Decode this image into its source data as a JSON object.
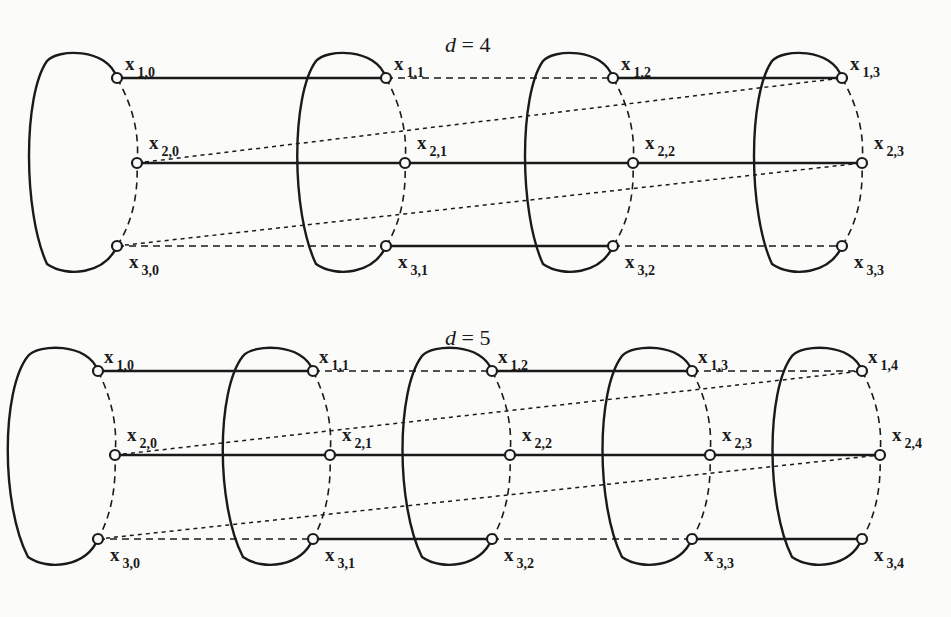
{
  "figure": {
    "panels": [
      {
        "title_var": "d",
        "title_eq": " = 4",
        "d": 4,
        "columns": 4,
        "rows": 3,
        "labels": [
          [
            "x_{1,0}",
            "x_{1,1}",
            "x_{1,2}",
            "x_{1,3}"
          ],
          [
            "x_{2,0}",
            "x_{2,1}",
            "x_{2,2}",
            "x_{2,3}"
          ],
          [
            "x_{3,0}",
            "x_{3,1}",
            "x_{3,2}",
            "x_{3,3}"
          ]
        ],
        "edges_solid": [
          [
            [
              1,
              0
            ],
            [
              1,
              1
            ]
          ],
          [
            [
              1,
              2
            ],
            [
              1,
              3
            ]
          ],
          [
            [
              2,
              0
            ],
            [
              2,
              1
            ]
          ],
          [
            [
              2,
              1
            ],
            [
              2,
              2
            ]
          ],
          [
            [
              2,
              2
            ],
            [
              2,
              3
            ]
          ],
          [
            [
              3,
              1
            ],
            [
              3,
              2
            ]
          ]
        ],
        "edges_dashed": [
          [
            [
              1,
              1
            ],
            [
              1,
              2
            ]
          ],
          [
            [
              3,
              0
            ],
            [
              3,
              1
            ]
          ],
          [
            [
              3,
              2
            ],
            [
              3,
              3
            ]
          ]
        ],
        "edges_wrap_dotted": [
          [
            [
              2,
              0
            ],
            [
              1,
              3
            ]
          ],
          [
            [
              3,
              0
            ],
            [
              2,
              3
            ]
          ]
        ]
      },
      {
        "title_var": "d",
        "title_eq": " = 5",
        "d": 5,
        "columns": 5,
        "rows": 3,
        "labels": [
          [
            "x_{1,0}",
            "x_{1,1}",
            "x_{1,2}",
            "x_{1,3}",
            "x_{1,4}"
          ],
          [
            "x_{2,0}",
            "x_{2,1}",
            "x_{2,2}",
            "x_{2,3}",
            "x_{2,4}"
          ],
          [
            "x_{3,0}",
            "x_{3,1}",
            "x_{3,2}",
            "x_{3,3}",
            "x_{3,4}"
          ]
        ],
        "edges_solid": [
          [
            [
              1,
              0
            ],
            [
              1,
              1
            ]
          ],
          [
            [
              1,
              2
            ],
            [
              1,
              3
            ]
          ],
          [
            [
              2,
              0
            ],
            [
              2,
              1
            ]
          ],
          [
            [
              2,
              1
            ],
            [
              2,
              2
            ]
          ],
          [
            [
              2,
              2
            ],
            [
              2,
              3
            ]
          ],
          [
            [
              2,
              3
            ],
            [
              2,
              4
            ]
          ],
          [
            [
              3,
              1
            ],
            [
              3,
              2
            ]
          ],
          [
            [
              3,
              3
            ],
            [
              3,
              4
            ]
          ]
        ],
        "edges_dashed": [
          [
            [
              1,
              1
            ],
            [
              1,
              2
            ]
          ],
          [
            [
              1,
              3
            ],
            [
              1,
              4
            ]
          ],
          [
            [
              3,
              0
            ],
            [
              3,
              1
            ]
          ],
          [
            [
              3,
              2
            ],
            [
              3,
              3
            ]
          ]
        ],
        "edges_wrap_dotted": [
          [
            [
              2,
              0
            ],
            [
              1,
              4
            ]
          ],
          [
            [
              3,
              0
            ],
            [
              2,
              4
            ]
          ]
        ]
      }
    ]
  }
}
